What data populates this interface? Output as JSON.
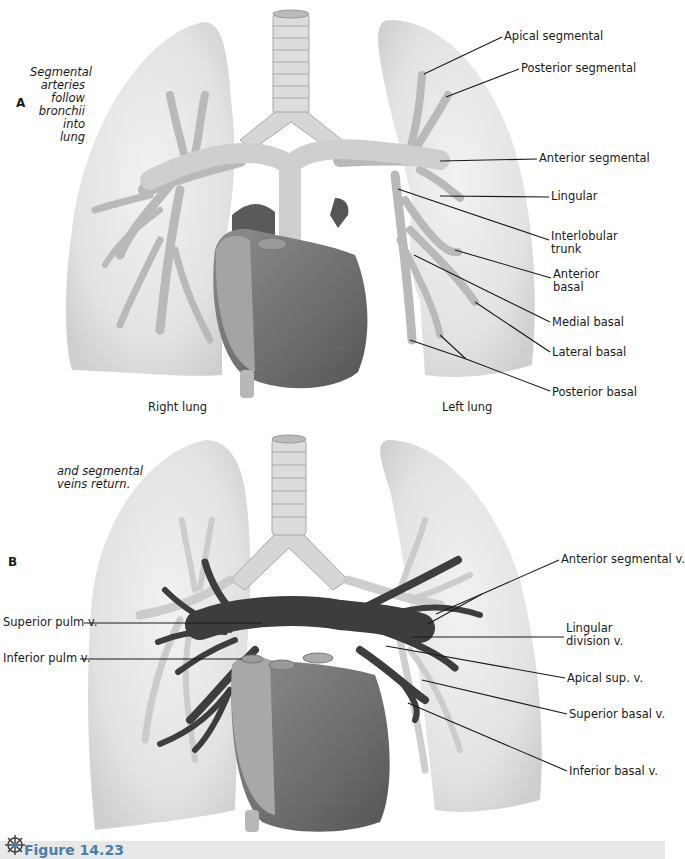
{
  "figure": {
    "number_label": "Figure 14.23",
    "icon": "atom-burst-icon",
    "accent_color": "#4a7fa8"
  },
  "panel_a": {
    "letter": "A",
    "caption_lines": [
      "Segmental",
      "arteries",
      "follow",
      "bronchii",
      "into",
      "lung"
    ],
    "right_lung_label": "Right lung",
    "left_lung_label": "Left lung",
    "labels": [
      {
        "text": "Apical segmental",
        "x": 504,
        "y": 30,
        "lines": [
          [
            502,
            37,
            424,
            74
          ]
        ]
      },
      {
        "text": "Posterior segmental",
        "x": 521,
        "y": 62,
        "lines": [
          [
            519,
            69,
            446,
            97
          ]
        ]
      },
      {
        "text": "Anterior segmental",
        "x": 539,
        "y": 152,
        "lines": [
          [
            537,
            159,
            440,
            161
          ]
        ]
      },
      {
        "text": "Lingular",
        "x": 551,
        "y": 190,
        "lines": [
          [
            549,
            197,
            440,
            196
          ]
        ]
      },
      {
        "text": "Interlobular\ntrunk",
        "x": 551,
        "y": 230,
        "lines": [
          [
            549,
            240,
            398,
            189
          ]
        ]
      },
      {
        "text": "Anterior\nbasal",
        "x": 553,
        "y": 268,
        "lines": [
          [
            551,
            278,
            455,
            250
          ]
        ]
      },
      {
        "text": "Medial basal",
        "x": 552,
        "y": 316,
        "lines": [
          [
            550,
            322,
            414,
            255
          ]
        ]
      },
      {
        "text": "Lateral basal",
        "x": 552,
        "y": 346,
        "lines": [
          [
            550,
            352,
            475,
            302
          ]
        ]
      },
      {
        "text": "Posterior basal",
        "x": 552,
        "y": 386,
        "lines": [
          [
            550,
            391,
            466,
            359
          ],
          [
            466,
            359,
            440,
            335
          ],
          [
            466,
            359,
            410,
            340
          ]
        ]
      }
    ]
  },
  "panel_b": {
    "letter": "B",
    "caption_lines": [
      "and segmental",
      "veins return."
    ],
    "labels": [
      {
        "text": "Anterior segmental v.",
        "x": 561,
        "y": 553,
        "lines": [
          [
            559,
            560,
            482,
            594
          ],
          [
            482,
            594,
            436,
            614
          ],
          [
            482,
            594,
            428,
            624
          ]
        ]
      },
      {
        "text": "Lingular\ndivision v.",
        "x": 566,
        "y": 622,
        "lines": [
          [
            564,
            637,
            412,
            637
          ]
        ]
      },
      {
        "text": "Apical sup. v.",
        "x": 567,
        "y": 672,
        "lines": [
          [
            565,
            678,
            386,
            646
          ]
        ]
      },
      {
        "text": "Superior basal v.",
        "x": 569,
        "y": 708,
        "lines": [
          [
            567,
            714,
            422,
            680
          ]
        ]
      },
      {
        "text": "Inferior basal v.",
        "x": 569,
        "y": 765,
        "lines": [
          [
            567,
            771,
            408,
            703
          ]
        ]
      },
      {
        "text": "Superior pulm v.",
        "x": 3,
        "y": 616,
        "lines": [
          [
            84,
            623,
            262,
            623
          ]
        ]
      },
      {
        "text": "Inferior pulm v.",
        "x": 3,
        "y": 652,
        "lines": [
          [
            80,
            659,
            242,
            659
          ]
        ]
      }
    ]
  }
}
